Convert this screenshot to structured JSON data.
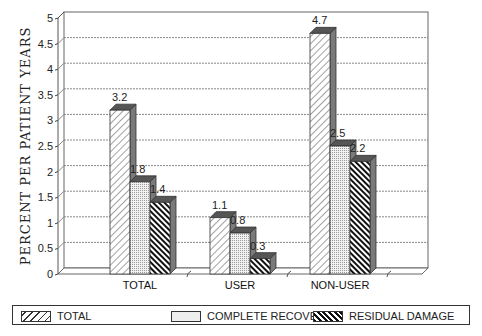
{
  "chart_data": {
    "type": "bar",
    "title": "",
    "xlabel": "",
    "ylabel": "PERCENT PER PATIENT YEARS",
    "ylim": [
      0,
      5
    ],
    "yticks": [
      "0",
      "0.5",
      "1",
      "1.5",
      "2",
      "2.5",
      "3",
      "3.5",
      "4",
      "4.5",
      "5"
    ],
    "grid": true,
    "legend_position": "bottom",
    "categories": [
      "TOTAL",
      "USER",
      "NON-USER"
    ],
    "series": [
      {
        "name": "TOTAL",
        "values": [
          3.2,
          1.1,
          4.7
        ],
        "pattern": "light-diagonal-hatch"
      },
      {
        "name": "COMPLETE RECOVERY",
        "values": [
          1.8,
          0.8,
          2.5
        ],
        "pattern": "dotted"
      },
      {
        "name": "RESIDUAL DAMAGE",
        "values": [
          1.4,
          0.3,
          2.2
        ],
        "pattern": "dark-diagonal-hatch"
      }
    ],
    "data_labels": [
      [
        "3.2",
        "1.8",
        "1.4"
      ],
      [
        "1.1",
        "0.8",
        "0.3"
      ],
      [
        "4.7",
        "2.5",
        "2.2"
      ]
    ],
    "style": "3d-clustered-bar"
  },
  "legend": {
    "items": [
      {
        "label": "TOTAL"
      },
      {
        "label": "COMPLETE RECOVERY"
      },
      {
        "label": "RESIDUAL DAMAGE"
      }
    ]
  }
}
